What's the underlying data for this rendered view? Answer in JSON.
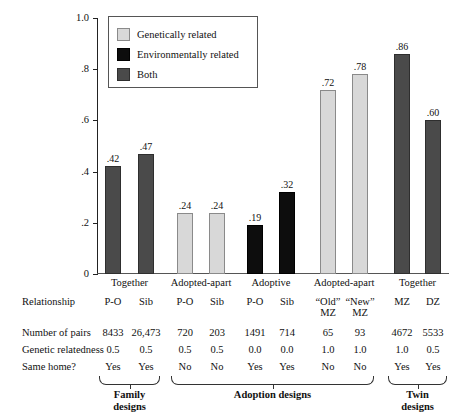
{
  "chart_data": {
    "type": "bar",
    "title": "",
    "xlabel": "",
    "ylabel": "Correlation",
    "ylim": [
      0,
      1.0
    ],
    "yticks": [
      "0",
      ".2",
      ".4",
      ".6",
      ".8",
      "1.0"
    ],
    "ytick_values": [
      0,
      0.2,
      0.4,
      0.6,
      0.8,
      1.0
    ],
    "grid": false,
    "legend_position": "upper-left-inset",
    "legend": [
      {
        "key": "geneticallyrelated",
        "label": "Genetically related",
        "color": "#d8d8d8"
      },
      {
        "key": "environmentallyrelated",
        "label": "Environmentally related",
        "color": "#0d0d0d"
      },
      {
        "key": "both",
        "label": "Both",
        "color": "#4a4a4a"
      }
    ],
    "categories": [
      "P-O",
      "Sib",
      "P-O",
      "Sib",
      "P-O",
      "Sib",
      "“Old” MZ",
      "“New” MZ",
      "MZ",
      "DZ"
    ],
    "values": [
      0.42,
      0.47,
      0.24,
      0.24,
      0.19,
      0.32,
      0.72,
      0.78,
      0.86,
      0.6
    ],
    "value_labels": [
      ".42",
      ".47",
      ".24",
      ".24",
      ".19",
      ".32",
      ".72",
      ".78",
      ".86",
      ".60"
    ],
    "series_keys": [
      "both",
      "both",
      "geneticallyrelated",
      "geneticallyrelated",
      "environmentallyrelated",
      "environmentallyrelated",
      "geneticallyrelated",
      "geneticallyrelated",
      "both",
      "both"
    ]
  },
  "group_headers": [
    {
      "label": "Together",
      "span": 2
    },
    {
      "label": "Adopted-apart",
      "span": 2
    },
    {
      "label": "Adoptive",
      "span": 2
    },
    {
      "label": "Adopted-apart",
      "span": 2
    },
    {
      "label": "Together",
      "span": 2
    }
  ],
  "table": {
    "row_labels": {
      "relationship": "Relationship",
      "pairs": "Number of pairs",
      "relatedness": "Genetic relatedness",
      "same_home": "Same home?"
    },
    "relationship": [
      "P-O",
      "Sib",
      "P-O",
      "Sib",
      "P-O",
      "Sib",
      "“Old”",
      "“New”",
      "MZ",
      "DZ"
    ],
    "relationship_line2": [
      "",
      "",
      "",
      "",
      "",
      "",
      "MZ",
      "MZ",
      "",
      ""
    ],
    "pairs": [
      "8433",
      "26,473",
      "720",
      "203",
      "1491",
      "714",
      "65",
      "93",
      "4672",
      "5533"
    ],
    "relatedness": [
      "0.5",
      "0.5",
      "0.5",
      "0.5",
      "0.0",
      "0.0",
      "1.0",
      "1.0",
      "1.0",
      "0.5"
    ],
    "same_home": [
      "Yes",
      "Yes",
      "No",
      "No",
      "Yes",
      "Yes",
      "No",
      "No",
      "Yes",
      "Yes"
    ]
  },
  "design_groups": [
    {
      "label_line1": "Family",
      "label_line2": "designs",
      "start": 0,
      "span": 2
    },
    {
      "label_line1": "Adoption designs",
      "label_line2": "",
      "start": 2,
      "span": 6
    },
    {
      "label_line1": "Twin",
      "label_line2": "designs",
      "start": 8,
      "span": 2
    }
  ]
}
